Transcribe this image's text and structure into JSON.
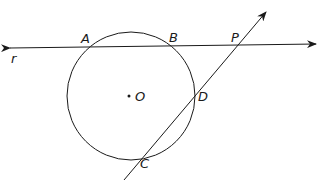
{
  "diagram": {
    "type": "geometry",
    "colors": {
      "stroke": "#1a1a1a",
      "background": "#ffffff"
    },
    "circle": {
      "center_label": "O",
      "cx": 131,
      "cy": 96,
      "r": 64
    },
    "lines": [
      {
        "name": "r",
        "label": "r",
        "from": [
          8,
          48
        ],
        "to": [
          318,
          44
        ],
        "arrows": "both"
      },
      {
        "name": "s",
        "label": "",
        "from": [
          124,
          180
        ],
        "to": [
          267,
          11
        ],
        "arrows": "end"
      }
    ],
    "points": {
      "A": {
        "label": "A",
        "x": 90,
        "y": 47
      },
      "B": {
        "label": "B",
        "x": 170,
        "y": 46
      },
      "P": {
        "label": "P",
        "x": 238,
        "y": 44
      },
      "D": {
        "label": "D",
        "x": 194,
        "y": 97
      },
      "C": {
        "label": "C",
        "x": 144,
        "y": 155
      },
      "O": {
        "label": "O",
        "x": 131,
        "y": 96
      }
    }
  }
}
